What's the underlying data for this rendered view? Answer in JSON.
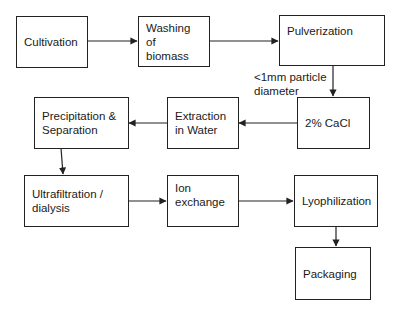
{
  "diagram": {
    "type": "process-flowchart",
    "steps": [
      {
        "id": "cultivation",
        "label": "Cultivation"
      },
      {
        "id": "washing",
        "label": "Washing of\nbiomass"
      },
      {
        "id": "pulverization",
        "label": "Pulverization"
      },
      {
        "id": "cacl",
        "label": "2% CaCl"
      },
      {
        "id": "extraction",
        "label": "Extraction\nin Water"
      },
      {
        "id": "precipitation",
        "label": "Precipitation &\nSeparation"
      },
      {
        "id": "ultrafiltration",
        "label": "Ultrafiltration /\ndialysis"
      },
      {
        "id": "ion_exchange",
        "label": "Ion\nexchange"
      },
      {
        "id": "lyophilization",
        "label": "Lyophilization"
      },
      {
        "id": "packaging",
        "label": "Packaging"
      }
    ],
    "annotations": [
      {
        "id": "particle_note",
        "label": "<1mm particle\ndiameter",
        "attached_to": "pulverization->cacl"
      }
    ],
    "edges": [
      [
        "cultivation",
        "washing"
      ],
      [
        "washing",
        "pulverization"
      ],
      [
        "pulverization",
        "cacl"
      ],
      [
        "cacl",
        "extraction"
      ],
      [
        "extraction",
        "precipitation"
      ],
      [
        "precipitation",
        "ultrafiltration"
      ],
      [
        "ultrafiltration",
        "ion_exchange"
      ],
      [
        "ion_exchange",
        "lyophilization"
      ],
      [
        "lyophilization",
        "packaging"
      ]
    ]
  }
}
